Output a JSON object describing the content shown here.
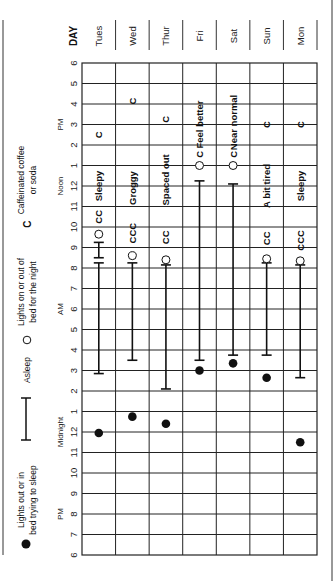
{
  "chart_data": {
    "type": "table",
    "orientation": "rotated 90° counter-clockwise (time axis runs bottom-to-top, days run left-to-right)",
    "day_header": "DAY",
    "days": [
      "Tues",
      "Wed",
      "Thur",
      "Fri",
      "Sat",
      "Sun",
      "Mon"
    ],
    "time_axis": {
      "range": [
        "6 PM",
        "6 PM (next day)"
      ],
      "ticks": [
        "6",
        "7",
        "8",
        "9",
        "10",
        "11",
        "12",
        "1",
        "2",
        "3",
        "4",
        "5",
        "6",
        "7",
        "8",
        "9",
        "10",
        "11",
        "12",
        "1",
        "2",
        "3",
        "4",
        "5",
        "6"
      ],
      "period_labels": [
        {
          "text": "PM",
          "at_hour": 2
        },
        {
          "text": "Midnight",
          "at_hour": 6
        },
        {
          "text": "AM",
          "at_hour": 12
        },
        {
          "text": "Noon",
          "at_hour": 18
        },
        {
          "text": "PM",
          "at_hour": 21
        }
      ]
    },
    "legend": [
      {
        "symbol": "filled-dot",
        "label": "Lights out or in bed trying to sleep"
      },
      {
        "symbol": "i-bar",
        "label": "Asleep"
      },
      {
        "symbol": "open-circle",
        "label": "Lights on or out of bed for the night"
      },
      {
        "symbol": "C",
        "label": "Caffeinated coffee or soda"
      }
    ],
    "series": [
      {
        "day": "Tues",
        "lights_out": 5.95,
        "asleep": [
          [
            8.85,
            14.25
          ],
          [
            14.5,
            15.25
          ]
        ],
        "lights_on": 15.65,
        "caffeine": [
          {
            "at": 16.5,
            "text": "CC"
          },
          {
            "at": 20.5,
            "text": "C"
          }
        ],
        "mood": {
          "text": "Sleepy",
          "at": 18.0
        }
      },
      {
        "day": "Wed",
        "lights_out": 6.75,
        "asleep": [
          [
            9.5,
            14.25
          ]
        ],
        "lights_on": 14.6,
        "caffeine": [
          {
            "at": 15.7,
            "text": "CCC"
          },
          {
            "at": 22.15,
            "text": "C"
          }
        ],
        "mood": {
          "text": "Groggy",
          "at": 17.9
        }
      },
      {
        "day": "Thur",
        "lights_out": 6.4,
        "asleep": [
          [
            8.1,
            14.15
          ]
        ],
        "lights_on": 14.4,
        "caffeine": [
          {
            "at": 15.5,
            "text": "CC"
          },
          {
            "at": 21.25,
            "text": "C"
          }
        ],
        "mood": {
          "text": "Spaced out",
          "at": 18.3
        }
      },
      {
        "day": "Fri",
        "lights_out": 9.0,
        "asleep": [
          [
            9.5,
            18.25
          ]
        ],
        "lights_on": 19.0,
        "caffeine": [
          {
            "at": 19.55,
            "text": "C"
          }
        ],
        "mood": {
          "text": "Feel better",
          "at": 21.0
        }
      },
      {
        "day": "Sat",
        "lights_out": 9.35,
        "asleep": [
          [
            9.75,
            18.1
          ]
        ],
        "lights_on": 19.0,
        "caffeine": [
          {
            "at": 19.55,
            "text": "C"
          }
        ],
        "mood": {
          "text": "Near normal",
          "at": 21.1
        }
      },
      {
        "day": "Sun",
        "lights_out": 8.65,
        "asleep": [
          [
            9.75,
            14.25
          ]
        ],
        "lights_on": 14.45,
        "caffeine": [
          {
            "at": 15.45,
            "text": "CC"
          },
          {
            "at": 21.0,
            "text": "C"
          }
        ],
        "mood": {
          "text": "A bit tired",
          "at": 18.0
        }
      },
      {
        "day": "Mon",
        "lights_out": 5.5,
        "asleep": [
          [
            8.65,
            14.15
          ]
        ],
        "lights_on": 14.35,
        "caffeine": [
          {
            "at": 15.35,
            "text": "CCC"
          },
          {
            "at": 21.0,
            "text": "C"
          }
        ],
        "mood": {
          "text": "Sleepy",
          "at": 18.0
        }
      }
    ],
    "note": "Hour values are hours elapsed since 6 PM (0 = 6 PM, 6 = Midnight, 18 = Noon, 24 = 6 PM)."
  },
  "colors": {
    "ink": "#111111",
    "grid": "#222222",
    "muted": "#555555"
  }
}
